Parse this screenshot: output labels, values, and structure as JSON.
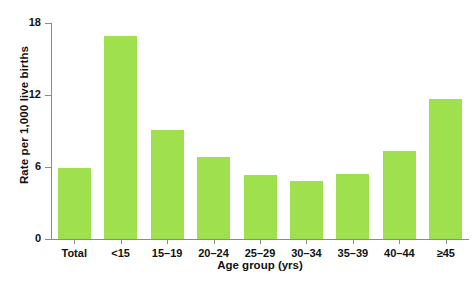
{
  "chart_data": {
    "type": "bar",
    "title": "",
    "subtitle": "",
    "xlabel": "Age group (yrs)",
    "ylabel": "Rate per 1,000 live births",
    "categories": [
      "Total",
      "<15",
      "15–19",
      "20–24",
      "25–29",
      "30–34",
      "35–39",
      "40–44",
      "≥45"
    ],
    "values": [
      5.9,
      16.9,
      9.1,
      6.8,
      5.3,
      4.8,
      5.4,
      7.3,
      11.7
    ],
    "series": [
      {
        "name": "Rate per 1,000 live births",
        "values": [
          5.9,
          16.9,
          9.1,
          6.8,
          5.3,
          4.8,
          5.4,
          7.3,
          11.7
        ]
      }
    ],
    "ylim": [
      0,
      18
    ],
    "yticks": [
      0,
      6,
      12,
      18
    ],
    "ytick_labels": [
      "0",
      "6",
      "12",
      "18"
    ],
    "xlim_categorical": true,
    "grid": false,
    "legend": false,
    "legend_position": "none",
    "bar_color": "#9fe04f",
    "axis_color": "#8a8a8a",
    "text_color": "#111111",
    "background": "#ffffff"
  }
}
